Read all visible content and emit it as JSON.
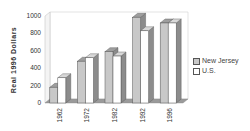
{
  "chart_data": {
    "type": "bar",
    "style": "3d-clustered",
    "title": "",
    "xlabel": "",
    "ylabel": "Real 1996 Dollars",
    "ylim": [
      0,
      1000
    ],
    "yticks": [
      0,
      200,
      400,
      600,
      800,
      1000
    ],
    "categories": [
      "1962",
      "1972",
      "1982",
      "1992",
      "1996"
    ],
    "series": [
      {
        "name": "New Jersey",
        "color": "#c8c8c8",
        "values": [
          180,
          480,
          590,
          985,
          920
        ]
      },
      {
        "name": "U.S.",
        "color": "#ffffff",
        "values": [
          290,
          520,
          540,
          830,
          920
        ]
      }
    ],
    "grid": false,
    "legend_position": "right"
  },
  "legend": {
    "items": [
      {
        "label": "New Jersey"
      },
      {
        "label": "U.S."
      }
    ]
  }
}
